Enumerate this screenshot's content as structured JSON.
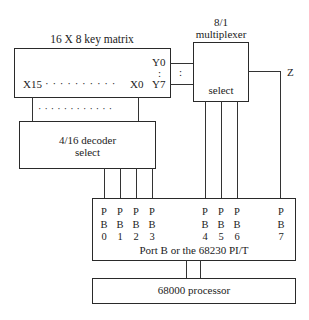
{
  "key_matrix": {
    "title": "16 X 8 key matrix",
    "y0": "Y0",
    "colon": ":",
    "y7": "Y7",
    "x15": "X15",
    "x0": "X0",
    "dots_row": "· · · · · · · · · ·",
    "dots_lower": "· · · · · · · · · · · ·"
  },
  "multiplexer": {
    "title_line1": "8/1",
    "title_line2": "multiplexer",
    "select": "select",
    "bus_colon": ":",
    "output": "Z"
  },
  "decoder": {
    "line1": "4/16 decoder",
    "line2": "select"
  },
  "port_b": {
    "label": "Port B or the 68230 PI/T",
    "pins": [
      {
        "p": "P",
        "b": "B",
        "n": "0"
      },
      {
        "p": "P",
        "b": "B",
        "n": "1"
      },
      {
        "p": "P",
        "b": "B",
        "n": "2"
      },
      {
        "p": "P",
        "b": "B",
        "n": "3"
      },
      {
        "p": "P",
        "b": "B",
        "n": "4"
      },
      {
        "p": "P",
        "b": "B",
        "n": "5"
      },
      {
        "p": "P",
        "b": "B",
        "n": "6"
      },
      {
        "p": "P",
        "b": "B",
        "n": "7"
      }
    ]
  },
  "processor": {
    "label": "68000 processor"
  }
}
